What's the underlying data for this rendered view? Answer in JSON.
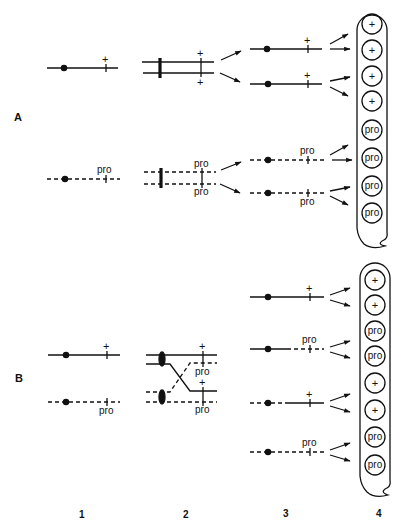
{
  "figure": {
    "panel_labels": [
      "A",
      "B"
    ],
    "column_labels": [
      "1",
      "2",
      "3",
      "4"
    ],
    "marker_plus": "+",
    "marker_pro": "pro",
    "panel_A": {
      "stage1": [
        {
          "chromosome": "solid",
          "allele": "+"
        },
        {
          "chromosome": "dashed",
          "allele": "pro"
        }
      ],
      "stage2": [
        {
          "pair": "solid",
          "alleles": [
            "+",
            "+"
          ]
        },
        {
          "pair": "dashed",
          "alleles": [
            "pro",
            "pro"
          ]
        }
      ],
      "stage3": [
        {
          "chromosome": "solid",
          "allele": "+"
        },
        {
          "chromosome": "solid",
          "allele": "+"
        },
        {
          "chromosome": "dashed",
          "allele": "pro"
        },
        {
          "chromosome": "dashed",
          "allele": "pro"
        }
      ],
      "ascus_spores": [
        "+",
        "+",
        "+",
        "+",
        "pro",
        "pro",
        "pro",
        "pro"
      ]
    },
    "panel_B": {
      "stage1": [
        {
          "chromosome": "solid",
          "allele": "+"
        },
        {
          "chromosome": "dashed",
          "allele": "pro"
        }
      ],
      "stage2": [
        {
          "strand": "solid",
          "allele": "+"
        },
        {
          "strand": "solid-to-dashed crossover",
          "allele": "pro"
        },
        {
          "strand": "dashed-to-solid crossover",
          "allele": "+"
        },
        {
          "strand": "dashed",
          "allele": "pro"
        }
      ],
      "stage3": [
        {
          "chromosome": "solid",
          "allele": "+"
        },
        {
          "chromosome": "solid-dashed",
          "allele": "pro"
        },
        {
          "chromosome": "dashed-solid",
          "allele": "+"
        },
        {
          "chromosome": "dashed",
          "allele": "pro"
        }
      ],
      "ascus_spores": [
        "+",
        "+",
        "pro",
        "pro",
        "+",
        "+",
        "pro",
        "pro"
      ]
    }
  }
}
